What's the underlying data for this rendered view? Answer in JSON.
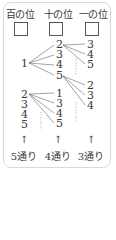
{
  "headers": {
    "hundreds": "百の位",
    "tens": "十の位",
    "ones": "一の位"
  },
  "tree": {
    "root_first": "1",
    "first_tens": [
      "2",
      "3",
      "4",
      "5"
    ],
    "first_ones_of_2": [
      "3",
      "4",
      "5"
    ],
    "first_ones_of_5": [
      "2",
      "3",
      "4"
    ],
    "other_hundreds": [
      "2",
      "3",
      "4",
      "5"
    ],
    "second_tens_of_2": [
      "1",
      "3",
      "4",
      "5"
    ]
  },
  "footer": {
    "arrow": "↑",
    "hundreds_count": "5通り",
    "tens_count": "4通り",
    "ones_count": "3通り"
  }
}
